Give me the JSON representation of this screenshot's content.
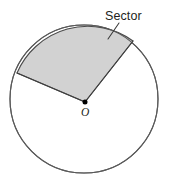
{
  "figure": {
    "labels": {
      "sector": "Sector",
      "center": "O"
    },
    "colors": {
      "sector_fill": "#d2d2d2",
      "sector_stroke": "#4a4a4a",
      "circle_stroke": "#5a5a5a",
      "circle_fill": "#ffffff",
      "center_dot": "#000000",
      "leader_line": "#3a3a3a",
      "text": "#231f20",
      "background": "#ffffff"
    },
    "geometry": {
      "circle": {
        "cx": 84,
        "cy": 99,
        "r": 74
      },
      "center_point": {
        "x": 85,
        "y": 102
      },
      "sector": {
        "start_angle_deg": 35,
        "end_angle_deg": 127,
        "radius": 74,
        "arc_start": {
          "x": 145,
          "y": 57
        },
        "arc_end": {
          "x": 40,
          "y": 50
        },
        "radius_a_end": {
          "x": 133,
          "y": 41
        },
        "radius_b_end": {
          "x": 17,
          "y": 73
        }
      },
      "leader_line": {
        "x1": 119,
        "y1": 23,
        "x2": 108,
        "y2": 39
      },
      "sector_label_pos": {
        "x": 105,
        "y": 20
      },
      "center_label_pos": {
        "x": 82,
        "y": 115
      }
    }
  }
}
